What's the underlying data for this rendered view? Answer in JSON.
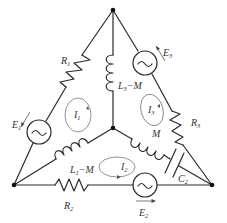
{
  "diagram": {
    "type": "circuit",
    "nodes": {
      "top": [
        113,
        10
      ],
      "center": [
        113,
        128
      ],
      "bottom_left": [
        14,
        185
      ],
      "bottom_right": [
        212,
        185
      ]
    },
    "labels": {
      "R1": "R",
      "R1_sub": "1",
      "R2": "R",
      "R2_sub": "2",
      "R3": "R",
      "R3_sub": "3",
      "E1": "E",
      "E1_sub": "1",
      "E2": "E",
      "E2_sub": "2",
      "E3": "E",
      "E3_sub": "3",
      "C2": "C",
      "C2_sub": "2",
      "L3M": "L",
      "L3M_sub": "3",
      "L3M_rest": "−M",
      "L1M": "L",
      "L1M_sub": "1",
      "L1M_rest": "−M",
      "M": "M",
      "I1": "I",
      "I1_sub": "1",
      "I2": "I",
      "I2_sub": "2",
      "I3": "I",
      "I3_sub": "3"
    },
    "components": [
      {
        "name": "R1",
        "kind": "resistor",
        "branch": "top-bottom_left"
      },
      {
        "name": "E1",
        "kind": "ac-source",
        "branch": "top-bottom_left"
      },
      {
        "name": "L3-M",
        "kind": "inductor",
        "branch": "top-center"
      },
      {
        "name": "E3",
        "kind": "ac-source",
        "branch": "top-bottom_right"
      },
      {
        "name": "R3",
        "kind": "resistor",
        "branch": "top-bottom_right"
      },
      {
        "name": "L1-M",
        "kind": "inductor",
        "branch": "center-bottom_left"
      },
      {
        "name": "M",
        "kind": "inductor",
        "branch": "center-bottom_right"
      },
      {
        "name": "C2",
        "kind": "capacitor",
        "branch": "center-bottom_right"
      },
      {
        "name": "R2",
        "kind": "resistor",
        "branch": "bottom_left-bottom_right"
      },
      {
        "name": "E2",
        "kind": "ac-source",
        "branch": "bottom_left-bottom_right"
      }
    ],
    "loop_currents": [
      "I1",
      "I2",
      "I3"
    ]
  }
}
